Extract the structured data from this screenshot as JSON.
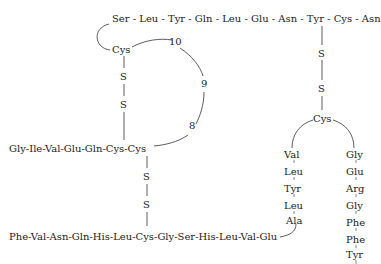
{
  "a_chain_top": "Ser - Leu - Tyr - Gln - Leu - Glu - Asn - Tyr - Cys - Asn",
  "a_chain_loop": {
    "cys": "Cys",
    "n10": "10",
    "n9": "9",
    "n8": "8"
  },
  "a_chain_start": "Gly-Ile-Val-Glu-Gln-Cys-Cys",
  "b_chain": "Phe-Val-Asn-Gln-His-Leu-Cys-Gly-Ser-His-Leu-Val-Glu",
  "disulfide": {
    "s": "S"
  },
  "b_turn_cys": "Cys",
  "b_left": [
    "Val",
    "Leu",
    "Tyr",
    "Leu",
    "Ala"
  ],
  "b_right": [
    "Gly",
    "Glu",
    "Arg",
    "Gly",
    "Phe",
    "Phe",
    "Tyr"
  ]
}
